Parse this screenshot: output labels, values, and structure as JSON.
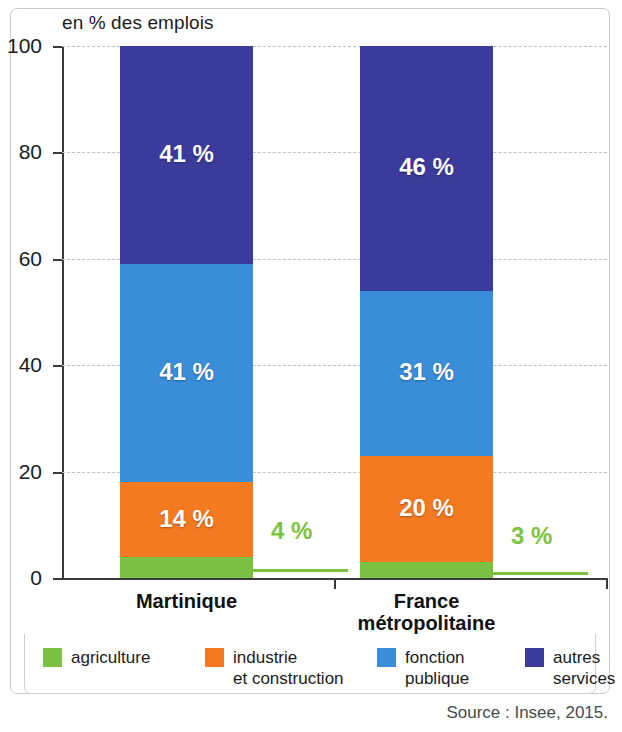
{
  "chart_data": {
    "type": "bar",
    "subtype": "stacked-100-percent",
    "title": "en % des emplois",
    "xlabel": "",
    "ylabel": "",
    "ylim": [
      0,
      100
    ],
    "yticks": [
      0,
      20,
      40,
      60,
      80,
      100
    ],
    "ytick_labels": [
      "0",
      "20",
      "40",
      "60",
      "80",
      "100"
    ],
    "grid": true,
    "grid_style": "dashed-horizontal",
    "legend_position": "bottom",
    "categories": [
      "Martinique",
      "France métropolitaine"
    ],
    "category_label_lines": [
      [
        "Martinique"
      ],
      [
        "France",
        "métropolitaine"
      ]
    ],
    "series": [
      {
        "name": "agriculture",
        "color": "#7cc242",
        "values": [
          4,
          3
        ],
        "value_labels": [
          "4 %",
          "3 %"
        ],
        "label_placement": "outside-callout"
      },
      {
        "name": "industrie et construction",
        "color": "#f47a21",
        "values": [
          14,
          20
        ],
        "value_labels": [
          "14 %",
          "20 %"
        ],
        "label_placement": "inside"
      },
      {
        "name": "fonction publique",
        "color": "#3a8dd8",
        "values": [
          41,
          31
        ],
        "value_labels": [
          "41 %",
          "31 %"
        ],
        "label_placement": "inside"
      },
      {
        "name": "autres services",
        "color": "#3b3b9b",
        "values": [
          41,
          46
        ],
        "value_labels": [
          "41 %",
          "46 %"
        ],
        "label_placement": "inside"
      }
    ],
    "source": "Source : Insee, 2015."
  },
  "legend": {
    "items": [
      {
        "label": "agriculture",
        "color": "#7cc242"
      },
      {
        "label": "industrie\net construction",
        "color": "#f47a21"
      },
      {
        "label": "fonction\npublique",
        "color": "#3a8dd8"
      },
      {
        "label": "autres\nservices",
        "color": "#3b3b9b"
      }
    ]
  },
  "source_note": "Source : Insee, 2015.",
  "colors": {
    "agriculture": "#7cc242",
    "industrie": "#f47a21",
    "fonction_publique": "#3a8dd8",
    "autres_services": "#3b3b9b",
    "axis": "#3a3a3a",
    "grid": "#bfbfc6",
    "frame": "#c9c9c9",
    "callout": "#7cc242"
  }
}
